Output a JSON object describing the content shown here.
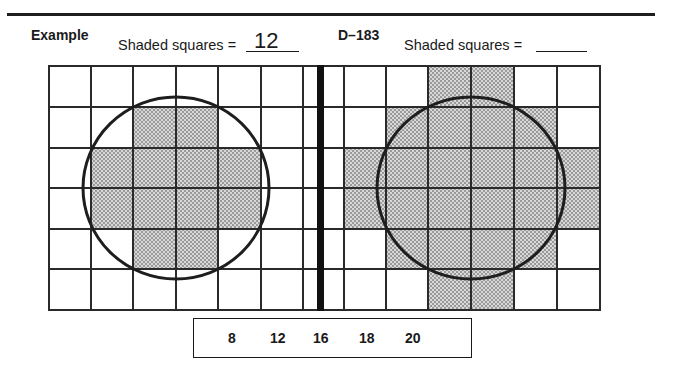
{
  "worksheet": {
    "example": {
      "label": "Example",
      "prompt": "Shaded squares =",
      "answer": "12",
      "grid": {
        "rows": 6,
        "columns": 6,
        "shaded_cells": [
          [
            1,
            2
          ],
          [
            1,
            3
          ],
          [
            2,
            1
          ],
          [
            2,
            2
          ],
          [
            2,
            3
          ],
          [
            2,
            4
          ],
          [
            3,
            1
          ],
          [
            3,
            2
          ],
          [
            3,
            3
          ],
          [
            3,
            4
          ],
          [
            4,
            2
          ],
          [
            4,
            3
          ]
        ],
        "shaded_count": 12
      }
    },
    "problem": {
      "label": "D–183",
      "prompt": "Shaded squares =",
      "answer": "",
      "grid": {
        "rows": 6,
        "columns": 6,
        "shaded_cells": [
          [
            0,
            2
          ],
          [
            0,
            3
          ],
          [
            1,
            1
          ],
          [
            1,
            2
          ],
          [
            1,
            3
          ],
          [
            1,
            4
          ],
          [
            2,
            0
          ],
          [
            2,
            1
          ],
          [
            2,
            2
          ],
          [
            2,
            3
          ],
          [
            2,
            4
          ],
          [
            2,
            5
          ],
          [
            3,
            0
          ],
          [
            3,
            1
          ],
          [
            3,
            2
          ],
          [
            3,
            3
          ],
          [
            3,
            4
          ],
          [
            3,
            5
          ],
          [
            4,
            1
          ],
          [
            4,
            2
          ],
          [
            4,
            3
          ],
          [
            4,
            4
          ],
          [
            5,
            2
          ],
          [
            5,
            3
          ]
        ]
      }
    },
    "choices": [
      "8",
      "12",
      "16",
      "18",
      "20"
    ]
  },
  "colors": {
    "ink": "#1a1a1a",
    "shade": "#c8c8c8"
  }
}
